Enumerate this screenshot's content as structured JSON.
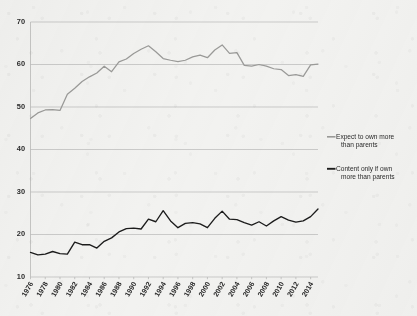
{
  "chart_data": {
    "type": "line",
    "title": "",
    "subtitle": "",
    "xlabel": "",
    "ylabel": "",
    "ylim": [
      10,
      70
    ],
    "ytick_values": [
      10,
      20,
      30,
      40,
      50,
      60,
      70
    ],
    "ytick_labels": [
      "10",
      "20",
      "30",
      "40",
      "50",
      "60",
      "70"
    ],
    "grid": true,
    "legend_position": "right",
    "xtick_labels": [
      "1976",
      "1978",
      "1980",
      "1982",
      "1984",
      "1986",
      "1988",
      "1990",
      "1992",
      "1994",
      "1996",
      "1998",
      "2000",
      "2002",
      "2004",
      "2006",
      "2008",
      "2010",
      "2012",
      "2014"
    ],
    "x": [
      1976,
      1977,
      1978,
      1979,
      1980,
      1981,
      1982,
      1983,
      1984,
      1985,
      1986,
      1987,
      1988,
      1989,
      1990,
      1991,
      1992,
      1993,
      1994,
      1995,
      1996,
      1997,
      1998,
      1999,
      2000,
      2001,
      2002,
      2003,
      2004,
      2005,
      2006,
      2007,
      2008,
      2009,
      2010,
      2011,
      2012,
      2013,
      2014,
      2015
    ],
    "series": [
      {
        "name": "Expect to own more than parents",
        "color": "#9a9a98",
        "values": [
          47.3,
          48.6,
          49.3,
          49.4,
          49.2,
          53.0,
          54.4,
          56.0,
          57.1,
          58.0,
          59.6,
          58.3,
          60.6,
          61.3,
          62.6,
          63.6,
          64.4,
          63.0,
          61.4,
          61.0,
          60.7,
          61.0,
          61.8,
          62.2,
          61.6,
          63.4,
          64.6,
          62.6,
          62.8,
          59.8,
          59.6,
          60.0,
          59.6,
          59.0,
          58.8,
          57.4,
          57.6,
          57.2,
          59.9,
          60.1
        ]
      },
      {
        "name": "Content only if own more than parents",
        "color": "#1c1c1c",
        "values": [
          15.8,
          15.2,
          15.4,
          16.0,
          15.5,
          15.4,
          18.2,
          17.6,
          17.6,
          16.8,
          18.4,
          19.2,
          20.6,
          21.4,
          21.5,
          21.3,
          23.6,
          23.0,
          25.6,
          23.2,
          21.6,
          22.6,
          22.8,
          22.5,
          21.6,
          23.8,
          25.5,
          23.6,
          23.5,
          22.8,
          22.2,
          23.0,
          22.0,
          23.2,
          24.2,
          23.4,
          22.9,
          23.2,
          24.2,
          26.0
        ]
      }
    ],
    "legend": [
      {
        "label_line1": "Expect to own more",
        "label_line2": "than parents",
        "color": "#9a9a98"
      },
      {
        "label_line1": "Content only if own",
        "label_line2": "more than parents",
        "color": "#1c1c1c"
      }
    ]
  }
}
